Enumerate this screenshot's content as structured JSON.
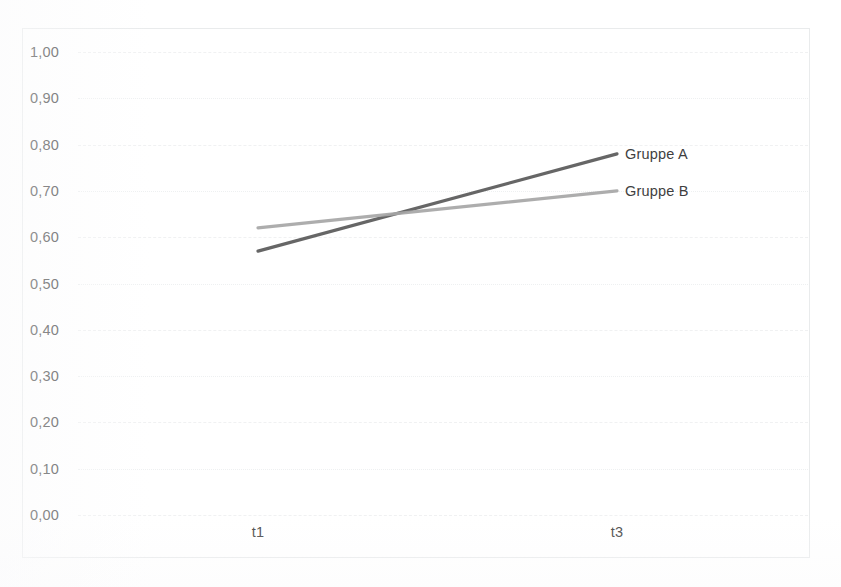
{
  "chart_data": {
    "type": "line",
    "title": "",
    "xlabel": "",
    "ylabel": "",
    "categories": [
      "t1",
      "t3"
    ],
    "ylim": [
      0.0,
      1.0
    ],
    "ytick_step": 0.1,
    "ytick_labels": [
      "1,00",
      "0,90",
      "0,80",
      "0,70",
      "0,60",
      "0,50",
      "0,40",
      "0,30",
      "0,20",
      "0,10",
      "0,00"
    ],
    "ytick_values": [
      1.0,
      0.9,
      0.8,
      0.7,
      0.6,
      0.5,
      0.4,
      0.3,
      0.2,
      0.1,
      0.0
    ],
    "grid": true,
    "grid_axis": "y",
    "legend_position": "right-at-line-end",
    "decimal_separator": ",",
    "series": [
      {
        "name": "Gruppe A",
        "values": [
          0.57,
          0.78
        ],
        "color": "#595959",
        "label": "Gruppe A"
      },
      {
        "name": "Gruppe B",
        "values": [
          0.62,
          0.7
        ],
        "color": "#a6a6a6",
        "label": "Gruppe B"
      }
    ]
  },
  "axes": {
    "y_labels": [
      {
        "text": "1,00",
        "value": 1.0
      },
      {
        "text": "0,90",
        "value": 0.9
      },
      {
        "text": "0,80",
        "value": 0.8
      },
      {
        "text": "0,70",
        "value": 0.7
      },
      {
        "text": "0,60",
        "value": 0.6
      },
      {
        "text": "0,50",
        "value": 0.5
      },
      {
        "text": "0,40",
        "value": 0.4
      },
      {
        "text": "0,30",
        "value": 0.3
      },
      {
        "text": "0,20",
        "value": 0.2
      },
      {
        "text": "0,10",
        "value": 0.1
      },
      {
        "text": "0,00",
        "value": 0.0
      }
    ],
    "x_labels": [
      {
        "text": "t1",
        "index": 0
      },
      {
        "text": "t3",
        "index": 1
      }
    ]
  },
  "legend": {
    "items": [
      {
        "label": "Gruppe A",
        "color": "#595959"
      },
      {
        "label": "Gruppe B",
        "color": "#a6a6a6"
      }
    ]
  },
  "colors": {
    "series_a": "#595959",
    "series_b": "#a6a6a6",
    "grid": "#f0f1f2",
    "border": "#e9ebec",
    "text": "#4a4a4a",
    "background": "#ffffff"
  }
}
